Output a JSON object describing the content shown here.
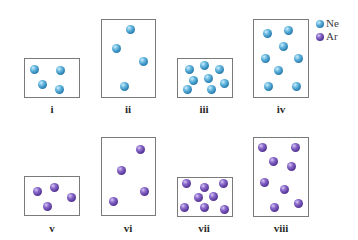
{
  "legend": [
    {
      "symbol": "Ne",
      "species": "ne",
      "color": "#2f86b8"
    },
    {
      "symbol": "Ar",
      "species": "ar",
      "color": "#5a3a9c"
    }
  ],
  "panels": [
    {
      "label": "i",
      "species": "ne",
      "box": {
        "x": 24,
        "y": 58,
        "w": 56,
        "h": 40
      },
      "label_pos": {
        "x": 52,
        "y": 103
      },
      "particles": [
        [
          34,
          69
        ],
        [
          60,
          70
        ],
        [
          42,
          84
        ],
        [
          59,
          89
        ]
      ]
    },
    {
      "label": "ii",
      "species": "ne",
      "box": {
        "x": 101,
        "y": 19,
        "w": 55,
        "h": 79
      },
      "label_pos": {
        "x": 128,
        "y": 103
      },
      "particles": [
        [
          130,
          29
        ],
        [
          116,
          48
        ],
        [
          143,
          61
        ],
        [
          124,
          86
        ]
      ]
    },
    {
      "label": "iii",
      "species": "ne",
      "box": {
        "x": 177,
        "y": 58,
        "w": 56,
        "h": 40
      },
      "label_pos": {
        "x": 204,
        "y": 103
      },
      "particles": [
        [
          189,
          69
        ],
        [
          204,
          65
        ],
        [
          219,
          69
        ],
        [
          193,
          80
        ],
        [
          208,
          78
        ],
        [
          224,
          83
        ],
        [
          187,
          89
        ],
        [
          211,
          89
        ]
      ]
    },
    {
      "label": "iv",
      "species": "ne",
      "box": {
        "x": 253,
        "y": 19,
        "w": 56,
        "h": 79
      },
      "label_pos": {
        "x": 281,
        "y": 103
      },
      "particles": [
        [
          267,
          33
        ],
        [
          288,
          30
        ],
        [
          283,
          46
        ],
        [
          265,
          58
        ],
        [
          298,
          58
        ],
        [
          278,
          70
        ],
        [
          268,
          86
        ],
        [
          296,
          86
        ]
      ]
    },
    {
      "label": "v",
      "species": "ar",
      "box": {
        "x": 24,
        "y": 176,
        "w": 56,
        "h": 40
      },
      "label_pos": {
        "x": 52,
        "y": 222
      },
      "particles": [
        [
          37,
          191
        ],
        [
          54,
          187
        ],
        [
          71,
          197
        ],
        [
          47,
          206
        ]
      ]
    },
    {
      "label": "vi",
      "species": "ar",
      "box": {
        "x": 101,
        "y": 137,
        "w": 55,
        "h": 79
      },
      "label_pos": {
        "x": 128,
        "y": 222
      },
      "particles": [
        [
          140,
          149
        ],
        [
          121,
          170
        ],
        [
          144,
          191
        ],
        [
          113,
          201
        ]
      ]
    },
    {
      "label": "vii",
      "species": "ar",
      "box": {
        "x": 177,
        "y": 177,
        "w": 56,
        "h": 40
      },
      "label_pos": {
        "x": 204,
        "y": 222
      },
      "particles": [
        [
          186,
          183
        ],
        [
          204,
          187
        ],
        [
          223,
          183
        ],
        [
          198,
          197
        ],
        [
          213,
          196
        ],
        [
          184,
          207
        ],
        [
          204,
          207
        ],
        [
          224,
          209
        ]
      ]
    },
    {
      "label": "viii",
      "species": "ar",
      "box": {
        "x": 253,
        "y": 137,
        "w": 56,
        "h": 80
      },
      "label_pos": {
        "x": 281,
        "y": 222
      },
      "particles": [
        [
          262,
          147
        ],
        [
          295,
          147
        ],
        [
          273,
          161
        ],
        [
          291,
          166
        ],
        [
          264,
          182
        ],
        [
          284,
          189
        ],
        [
          274,
          207
        ],
        [
          298,
          203
        ]
      ]
    }
  ]
}
